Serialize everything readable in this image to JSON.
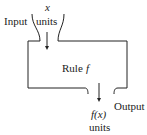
{
  "diagram": {
    "type": "function-machine",
    "input": {
      "label": "Input",
      "variable": "x",
      "units": "units"
    },
    "machine": {
      "label": "Rule",
      "function_name": "f"
    },
    "output": {
      "label": "Output",
      "value": "f(x)",
      "units": "units"
    },
    "colors": {
      "stroke": "#222222",
      "background": "#ffffff"
    }
  }
}
